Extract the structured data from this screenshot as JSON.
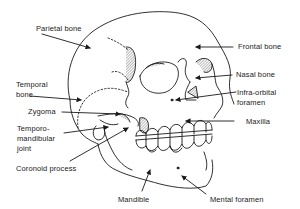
{
  "figure": {
    "labels": {
      "parietal_bone": "Parietal bone",
      "frontal_bone": "Frontal bone",
      "temporal_bone_1": "Temporal",
      "temporal_bone_2": "bone",
      "nasal_bone": "Nasal bone",
      "infra_orbital_1": "Infra-orbital",
      "infra_orbital_2": "foramen",
      "zygoma": "Zygoma",
      "maxilla": "Maxilla",
      "tmj_1": "Temporo-",
      "tmj_2": "mandibular",
      "tmj_3": "joint",
      "coronoid_process": "Coronoid process",
      "mandible": "Mandible",
      "mental_foramen": "Mental foramen"
    },
    "colors": {
      "ink": "#1a1a1a",
      "background": "#ffffff"
    }
  }
}
